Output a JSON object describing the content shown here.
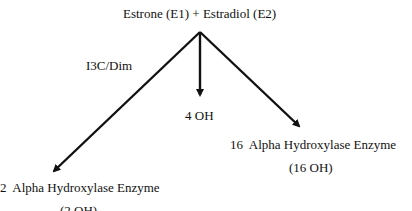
{
  "diagram": {
    "source": {
      "label": "Estrone (E1) + Estradiol (E2)"
    },
    "edge_labels": {
      "left": "I3C/Dim"
    },
    "targets": {
      "left": {
        "line1": "2  Alpha Hydroxylase Enzyme",
        "line2": "(2 OH)"
      },
      "center": {
        "line1": "4 OH"
      },
      "right": {
        "line1": "16  Alpha Hydroxylase Enzyme",
        "line2": "(16 OH)"
      }
    },
    "colors": {
      "ink": "#111111",
      "background": "#ffffff"
    }
  }
}
